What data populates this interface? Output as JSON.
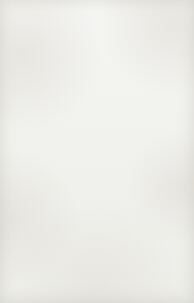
{
  "figure": {
    "view": "dorsal",
    "background_color": "#f3f3f1",
    "ink_color": "#20201e"
  },
  "labels": {
    "mandibles": "Mandibles",
    "head": "Head",
    "abdomen": "Abdomen",
    "natural_size_line1": "Natural",
    "natural_size_line2": "size",
    "tracheal_gills_line1": "Tracheal",
    "tracheal_gills_line2": "gills",
    "tail": "Tail"
  }
}
